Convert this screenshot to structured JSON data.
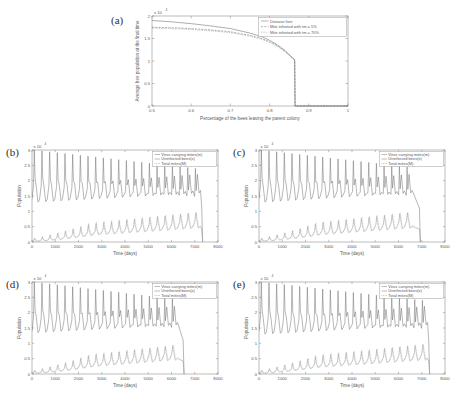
{
  "figure": {
    "panels": [
      "a",
      "b",
      "c",
      "d",
      "e"
    ]
  },
  "panel_a": {
    "label": "(a)",
    "xlabel": "Percentage of the bees leaving the parent colony",
    "ylabel": "Average bee population at the final time",
    "exponent": "x 10",
    "exponent_sup": "4",
    "xticks": [
      "0.5",
      "0.6",
      "0.7",
      "0.8",
      "0.9",
      "1"
    ],
    "yticks": [
      "0",
      "0.5",
      "1",
      "1.5",
      "2"
    ],
    "legend": [
      "Disease free",
      "Mite infested with tm = 5%",
      "Mite infested with tm = 70%"
    ]
  },
  "panel_b": {
    "label": "(b)",
    "xlabel": "Time (days)",
    "ylabel": "Population",
    "exponent": "x 10",
    "exponent_sup": "4",
    "xticks": [
      "0",
      "1000",
      "2000",
      "3000",
      "4000",
      "5000",
      "6000",
      "7000",
      "8000"
    ],
    "yticks": [
      "0",
      "0.5",
      "1",
      "1.5",
      "2",
      "2.5",
      "3"
    ],
    "legend": [
      "Virus carrying mites(m)",
      "Uninfected bees(x)",
      "Total mites(M)"
    ]
  },
  "panel_c": {
    "label": "(c)",
    "xlabel": "Time (days)",
    "ylabel": "Population",
    "exponent": "x 10",
    "exponent_sup": "4",
    "xticks": [
      "0",
      "1000",
      "2000",
      "3000",
      "4000",
      "5000",
      "6000",
      "7000",
      "8000"
    ],
    "yticks": [
      "0",
      "0.5",
      "1",
      "1.5",
      "2",
      "2.5",
      "3"
    ],
    "legend": [
      "Virus carrying mites(m)",
      "Uninfected bees(x)",
      "Total mites(M)"
    ]
  },
  "panel_d": {
    "label": "(d)",
    "xlabel": "Time (days)",
    "ylabel": "Population",
    "exponent": "x 10",
    "exponent_sup": "4",
    "xticks": [
      "0",
      "1000",
      "2000",
      "3000",
      "4000",
      "5000",
      "6000",
      "7000",
      "8000"
    ],
    "yticks": [
      "0",
      "0.5",
      "1",
      "1.5",
      "2",
      "2.5",
      "3"
    ],
    "legend": [
      "Virus carrying mites(m)",
      "Uninfected bees(x)",
      "Total mites(M)"
    ]
  },
  "panel_e": {
    "label": "(e)",
    "xlabel": "Time (days)",
    "ylabel": "Population",
    "exponent": "x 10",
    "exponent_sup": "4",
    "xticks": [
      "0",
      "1000",
      "2000",
      "3000",
      "4000",
      "5000",
      "6000",
      "7000",
      "8000"
    ],
    "yticks": [
      "0",
      "0.5",
      "1",
      "1.5",
      "2",
      "2.5",
      "3"
    ],
    "legend": [
      "Virus carrying mites(m)",
      "Uninfected bees(x)",
      "Total mites(M)"
    ]
  },
  "chart_data": [
    {
      "type": "line",
      "panel": "a",
      "title": "",
      "xlabel": "Percentage of the bees leaving the parent colony",
      "ylabel": "Average bee population at the final time",
      "xlim": [
        0.5,
        1.0
      ],
      "ylim": [
        0,
        20000
      ],
      "y_exponent": 4,
      "grid": false,
      "legend_position": "upper-right",
      "series": [
        {
          "name": "Disease free",
          "style": "solid",
          "x": [
            0.5,
            0.55,
            0.6,
            0.65,
            0.7,
            0.75,
            0.78,
            0.8,
            0.82,
            0.84,
            0.85,
            0.86,
            0.864,
            0.865,
            0.87,
            0.9,
            1.0
          ],
          "values": [
            19000,
            18700,
            18300,
            17800,
            17200,
            16200,
            15400,
            14600,
            13600,
            12300,
            11400,
            10600,
            10300,
            0,
            0,
            0,
            0
          ]
        },
        {
          "name": "Mite infested with tm = 5%",
          "style": "dashed",
          "x": [
            0.5,
            0.55,
            0.6,
            0.65,
            0.7,
            0.75,
            0.78,
            0.8,
            0.82,
            0.84,
            0.85,
            0.86,
            0.864,
            0.865,
            0.87,
            0.9,
            1.0
          ],
          "values": [
            17500,
            17400,
            17200,
            16900,
            16500,
            15700,
            15000,
            14300,
            13400,
            12100,
            11300,
            10500,
            10200,
            0,
            0,
            0,
            0
          ]
        },
        {
          "name": "Mite infested with tm = 70%",
          "style": "dotted",
          "x": [
            0.5,
            0.55,
            0.6,
            0.65,
            0.7,
            0.75,
            0.78,
            0.8,
            0.82,
            0.84,
            0.85,
            0.86,
            0.864,
            0.865,
            0.87,
            0.9,
            1.0
          ],
          "values": [
            17300,
            17200,
            17000,
            16700,
            16300,
            15500,
            14800,
            14100,
            13200,
            12000,
            11200,
            10400,
            10100,
            0,
            0,
            0,
            0
          ]
        }
      ]
    },
    {
      "type": "line",
      "panel": "b",
      "xlabel": "Time (days)",
      "ylabel": "Population",
      "xlim": [
        0,
        8000
      ],
      "ylim": [
        0,
        30000
      ],
      "y_exponent": 4,
      "grid": false,
      "legend_position": "upper-right",
      "collapse_time": 7300,
      "oscillation_period": 330,
      "series": [
        {
          "name": "Virus carrying mites(m)",
          "style": "solid",
          "description": "Upper oscillating band, peaks ~3.0e4 decaying to ~2.4e4, troughs ~1.3e4 rising to ~1.6e4",
          "peak_start": 30000,
          "peak_end": 24000,
          "trough_start": 13000,
          "trough_end": 16000
        },
        {
          "name": "Uninfected bees(x)",
          "style": "solid",
          "description": "Lower band ramping from 0 to ~0.6e4 with spikes to ~0.95e4",
          "peak_start": 4000,
          "peak_end": 9500,
          "trough_start": 1000,
          "trough_end": 4500
        },
        {
          "name": "Total mites(M)",
          "style": "dotted",
          "description": "Lower band overlapping, slightly above bees",
          "peak_start": 4500,
          "peak_end": 9800,
          "trough_start": 1200,
          "trough_end": 4800
        }
      ]
    },
    {
      "type": "line",
      "panel": "c",
      "xlabel": "Time (days)",
      "ylabel": "Population",
      "xlim": [
        0,
        8000
      ],
      "ylim": [
        0,
        30000
      ],
      "y_exponent": 4,
      "grid": false,
      "legend_position": "upper-right",
      "collapse_time": 6900,
      "oscillation_period": 330,
      "series": [
        {
          "name": "Virus carrying mites(m)",
          "style": "solid",
          "peak_start": 30000,
          "peak_end": 24500,
          "trough_start": 13000,
          "trough_end": 16000
        },
        {
          "name": "Uninfected bees(x)",
          "style": "solid",
          "peak_start": 4000,
          "peak_end": 9500,
          "trough_start": 1000,
          "trough_end": 4500
        },
        {
          "name": "Total mites(M)",
          "style": "dotted",
          "peak_start": 4500,
          "peak_end": 9800,
          "trough_start": 1200,
          "trough_end": 4800
        }
      ]
    },
    {
      "type": "line",
      "panel": "d",
      "xlabel": "Time (days)",
      "ylabel": "Population",
      "xlim": [
        0,
        8000
      ],
      "ylim": [
        0,
        30000
      ],
      "y_exponent": 4,
      "grid": false,
      "legend_position": "upper-right",
      "collapse_time": 6500,
      "oscillation_period": 330,
      "series": [
        {
          "name": "Virus carrying mites(m)",
          "style": "solid",
          "peak_start": 30000,
          "peak_end": 24500,
          "trough_start": 13500,
          "trough_end": 16000
        },
        {
          "name": "Uninfected bees(x)",
          "style": "solid",
          "peak_start": 4000,
          "peak_end": 9200,
          "trough_start": 1000,
          "trough_end": 4500
        },
        {
          "name": "Total mites(M)",
          "style": "dotted",
          "peak_start": 4500,
          "peak_end": 9500,
          "trough_start": 1200,
          "trough_end": 4800
        }
      ]
    },
    {
      "type": "line",
      "panel": "e",
      "xlabel": "Time (days)",
      "ylabel": "Population",
      "xlim": [
        0,
        8000
      ],
      "ylim": [
        0,
        30000
      ],
      "y_exponent": 4,
      "grid": false,
      "legend_position": "upper-right",
      "collapse_time": 7300,
      "oscillation_period": 330,
      "series": [
        {
          "name": "Virus carrying mites(m)",
          "style": "solid",
          "peak_start": 30000,
          "peak_end": 24000,
          "trough_start": 13000,
          "trough_end": 16000
        },
        {
          "name": "Uninfected bees(x)",
          "style": "solid",
          "peak_start": 4000,
          "peak_end": 9500,
          "trough_start": 1000,
          "trough_end": 4500
        },
        {
          "name": "Total mites(M)",
          "style": "dotted",
          "peak_start": 4500,
          "peak_end": 9800,
          "trough_start": 1200,
          "trough_end": 4800
        }
      ]
    }
  ]
}
